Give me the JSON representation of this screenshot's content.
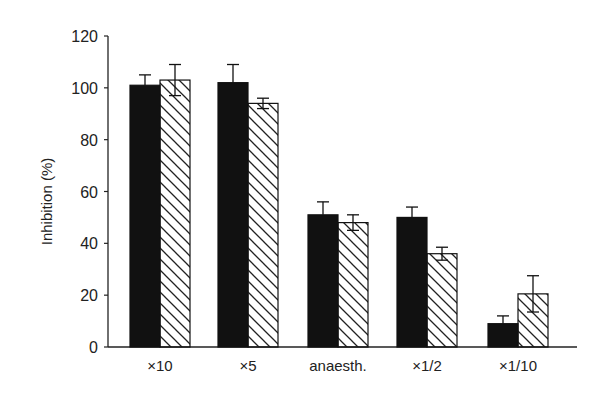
{
  "chart_data": {
    "type": "bar",
    "title": "",
    "xlabel": "",
    "ylabel": "Inhibition (%)",
    "ylim": [
      0,
      120
    ],
    "yticks": [
      0,
      20,
      40,
      60,
      80,
      100,
      120
    ],
    "grid": false,
    "legend": null,
    "categories": [
      "×10",
      "×5",
      "anaesth.",
      "×1/2",
      "×1/10"
    ],
    "series": [
      {
        "name": "solid",
        "fill": "#111111",
        "pattern": "solid",
        "values": [
          101,
          102,
          51,
          50,
          9
        ],
        "errors": [
          4,
          7,
          5,
          4,
          3
        ]
      },
      {
        "name": "hatched",
        "fill": "#ffffff",
        "pattern": "diagonal-hatch",
        "values": [
          103,
          94,
          48,
          36,
          20.5
        ],
        "errors": [
          6,
          2,
          3,
          2.5,
          7
        ]
      }
    ]
  }
}
